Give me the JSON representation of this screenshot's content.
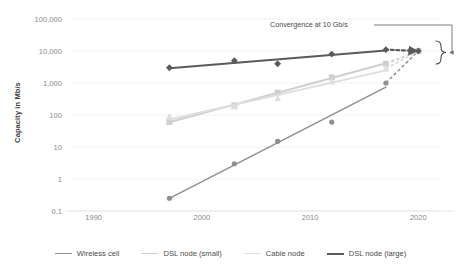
{
  "chart_data": {
    "type": "line",
    "title": "",
    "xlabel": "",
    "ylabel": "Capacity in Mb/s",
    "yscale": "log",
    "ylim": [
      0.1,
      100000
    ],
    "xlim": [
      1988,
      2022
    ],
    "grid": true,
    "legend_position": "bottom",
    "ytick_labels": [
      "100,000",
      "10,000",
      "1,000",
      "100",
      "10",
      "1",
      "0.1"
    ],
    "ytick_values": [
      100000,
      10000,
      1000,
      100,
      10,
      1,
      0.1
    ],
    "xtick_labels": [
      "1990",
      "2000",
      "2010",
      "2020"
    ],
    "xtick_values": [
      1990,
      2000,
      2010,
      2020
    ],
    "x": [
      1997,
      2003,
      2007,
      2012,
      2017
    ],
    "series": [
      {
        "name": "Wireless cell",
        "color": "#8f8f8f",
        "marker": "circle",
        "values": [
          0.25,
          3,
          15,
          60,
          1000
        ],
        "projection": {
          "x": [
            2017,
            2020
          ],
          "values": [
            1000,
            10000
          ],
          "style": "dashed"
        }
      },
      {
        "name": "DSL node (small)",
        "color": "#cfcfcf",
        "marker": "square",
        "values": [
          60,
          200,
          500,
          1500,
          4000
        ],
        "projection": {
          "x": [
            2017,
            2020
          ],
          "values": [
            4000,
            10000
          ],
          "style": "dashed"
        }
      },
      {
        "name": "Cable node",
        "color": "#dedede",
        "marker": "triangle",
        "values": [
          90,
          180,
          330,
          1100,
          2800
        ],
        "projection": {
          "x": [
            2017,
            2020
          ],
          "values": [
            2800,
            10000
          ],
          "style": "dashed"
        }
      },
      {
        "name": "DSL node (large)",
        "color": "#5a5a5a",
        "marker": "diamond",
        "values": [
          3000,
          5000,
          4000,
          8000,
          11000
        ],
        "projection": {
          "x": [
            2017,
            2020
          ],
          "values": [
            11000,
            10000
          ],
          "style": "dashed"
        }
      }
    ],
    "annotations": [
      {
        "text": "Convergence at 10 Gb/s",
        "target_value": 10000,
        "target_x": 2020
      }
    ]
  },
  "axis": {
    "y_title": "Capacity in Mb/s"
  },
  "annotation": {
    "convergence_label": "Convergence at 10 Gb/s"
  },
  "legend": {
    "items": [
      {
        "label": "Wireless cell",
        "color": "#8f8f8f",
        "width": "1.6px"
      },
      {
        "label": "DSL node (small)",
        "color": "#cfcfcf",
        "width": "1.8px"
      },
      {
        "label": "Cable node",
        "color": "#dedede",
        "width": "1.8px"
      },
      {
        "label": "DSL node (large)",
        "color": "#5a5a5a",
        "width": "2.2px"
      }
    ]
  }
}
